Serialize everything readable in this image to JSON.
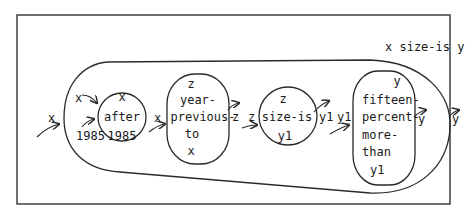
{
  "diagram": {
    "caption": "x size-is y",
    "input_outer": "x",
    "outer_inputs": {
      "x": "x",
      "year": "1985"
    },
    "nodes": [
      {
        "id": "after",
        "lines": [
          "x",
          "after",
          "1985"
        ]
      },
      {
        "id": "year-previous-to",
        "lines": [
          "z",
          "year-",
          "previous-",
          "to",
          "x"
        ]
      },
      {
        "id": "size-is",
        "lines": [
          "z",
          "size-is",
          "y1"
        ]
      },
      {
        "id": "fifteen-percent-more-than",
        "lines": [
          "y",
          "fifteen-",
          "percent-",
          "more-",
          "than",
          "y1"
        ]
      }
    ],
    "edge_labels": {
      "after_out": "x",
      "ypt_out": "z",
      "size_in": "z",
      "size_out": "y1",
      "fpmt_in": "y1",
      "fpmt_out": "y",
      "outer_out": "y"
    }
  }
}
